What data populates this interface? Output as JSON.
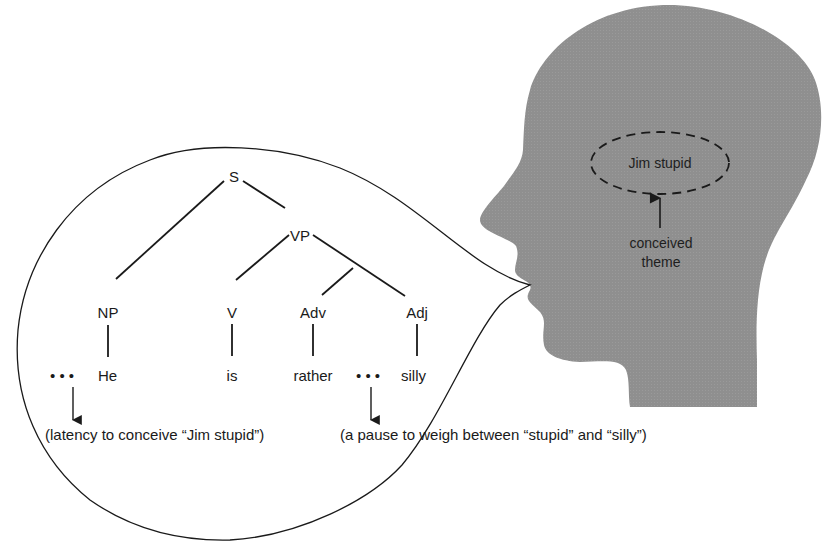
{
  "diagram": {
    "colors": {
      "head_fill": "#8f8f8f",
      "ink": "#1a1a1a",
      "background": "#ffffff"
    },
    "head": {
      "label": "head-silhouette",
      "thought": {
        "text": "Jim stupid",
        "shape": "dashed-ellipse"
      },
      "annotation": {
        "line1": "conceived",
        "line2": "theme"
      }
    },
    "speech_bubble": {
      "shape": "speech-bubble-from-mouth"
    },
    "tree": {
      "nodes": {
        "S": "S",
        "VP": "VP",
        "NP": "NP",
        "V": "V",
        "Adv": "Adv",
        "Adj": "Adj"
      },
      "words": {
        "he": "He",
        "is": "is",
        "rather": "rather",
        "silly": "silly"
      },
      "pause_marker": "• • •"
    },
    "notes": {
      "latency": "(latency to conceive “Jim stupid”)",
      "pause": "(a pause to weigh between “stupid” and “silly”)"
    }
  }
}
